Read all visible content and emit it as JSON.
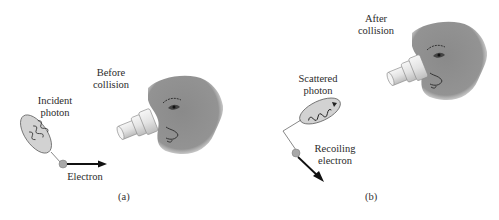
{
  "figure": {
    "panel_a": {
      "caption": "(a)",
      "state_label_line1": "Before",
      "state_label_line2": "collision",
      "photon_label_line1": "Incident",
      "photon_label_line2": "photon",
      "electron_label": "Electron"
    },
    "panel_b": {
      "caption": "(b)",
      "state_label_line1": "After",
      "state_label_line2": "collision",
      "photon_label_line1": "Scattered",
      "photon_label_line2": "photon",
      "electron_label_line1": "Recoiling",
      "electron_label_line2": "electron"
    },
    "colors": {
      "face": "#8f8f8f",
      "photon_ellipse": "#cfcfcf",
      "electron": "#a9a9a9",
      "arrow": "#111111",
      "microscope": "#e8e8e8"
    }
  }
}
